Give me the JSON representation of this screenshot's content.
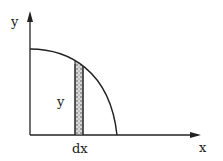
{
  "diagram": {
    "axis_y_label": "y",
    "axis_x_label": "x",
    "strip_height_label": "y",
    "strip_width_label": "dx",
    "colors": {
      "line": "#222222",
      "strip_fill": "#bbbbbb",
      "background": "#ffffff"
    }
  }
}
